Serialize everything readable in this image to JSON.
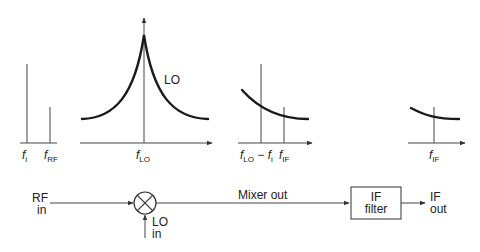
{
  "spectra": {
    "input": {
      "f_i": {
        "base": "f",
        "sub": "i"
      },
      "f_rf": {
        "base": "f",
        "sub": "RF"
      }
    },
    "lo": {
      "curve_label": "LO",
      "f_lo": {
        "base": "f",
        "sub": "LO"
      }
    },
    "mixer_output": {
      "image": {
        "base": "f",
        "sub": "LO",
        "minus": " − ",
        "base2": "f",
        "sub2": "i"
      },
      "f_if": {
        "base": "f",
        "sub": "IF"
      }
    },
    "if_output": {
      "f_if": {
        "base": "f",
        "sub": "IF"
      }
    }
  },
  "block_diagram": {
    "rf_in": [
      "RF",
      "in"
    ],
    "lo_in": [
      "LO",
      "in"
    ],
    "mixer_out": "Mixer out",
    "if_filter": [
      "IF",
      "filter"
    ],
    "if_out": [
      "IF",
      "out"
    ],
    "mixer_symbol": "mixer-multiply-icon"
  },
  "colors": {
    "line": "#444444",
    "curve": "#1a1a1a",
    "text": "#222222"
  }
}
